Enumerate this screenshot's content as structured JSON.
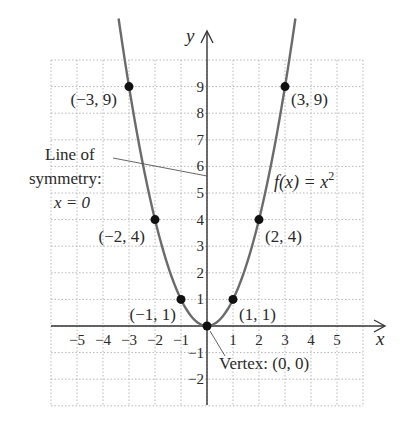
{
  "chart_data": {
    "type": "line",
    "title": "",
    "function_label": "f(x) = x",
    "function_exponent": "2",
    "xlabel": "x",
    "ylabel": "y",
    "xlim": [
      -6,
      6
    ],
    "ylim": [
      -3,
      10
    ],
    "grid": true,
    "x_ticks": [
      "−5",
      "−4",
      "−3",
      "−2",
      "−1",
      "1",
      "2",
      "3",
      "4",
      "5"
    ],
    "x_tick_values": [
      -5,
      -4,
      -3,
      -2,
      -1,
      1,
      2,
      3,
      4,
      5
    ],
    "y_ticks": [
      "9",
      "8",
      "7",
      "6",
      "5",
      "4",
      "3",
      "2",
      "1",
      "−1",
      "−2"
    ],
    "y_tick_values": [
      9,
      8,
      7,
      6,
      5,
      4,
      3,
      2,
      1,
      -1,
      -2
    ],
    "series": [
      {
        "name": "f(x) = x^2",
        "x": [
          -3,
          -2,
          -1,
          0,
          1,
          2,
          3
        ],
        "y": [
          9,
          4,
          1,
          0,
          1,
          4,
          9
        ]
      }
    ],
    "points": [
      {
        "x": -3,
        "y": 9,
        "label": "(−3, 9)"
      },
      {
        "x": -2,
        "y": 4,
        "label": "(−2, 4)"
      },
      {
        "x": -1,
        "y": 1,
        "label": "(−1, 1)"
      },
      {
        "x": 0,
        "y": 0,
        "label": ""
      },
      {
        "x": 1,
        "y": 1,
        "label": "(1, 1)"
      },
      {
        "x": 2,
        "y": 4,
        "label": "(2, 4)"
      },
      {
        "x": 3,
        "y": 9,
        "label": "(3, 9)"
      }
    ],
    "annotations": {
      "symmetry_line1": "Line of",
      "symmetry_line2": "symmetry:",
      "symmetry_line3": "x = 0",
      "vertex": "Vertex: (0, 0)"
    }
  }
}
